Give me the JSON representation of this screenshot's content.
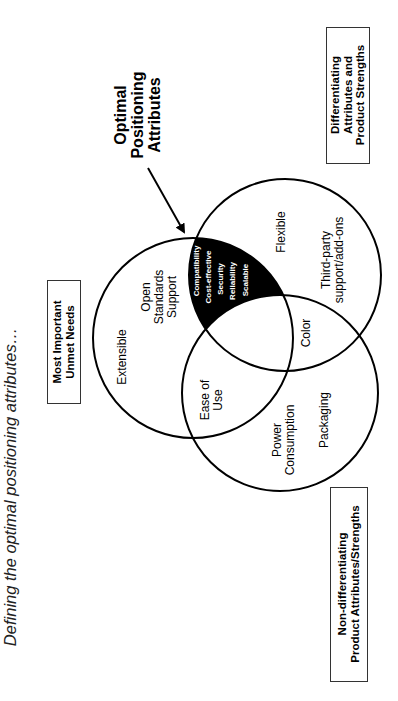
{
  "title": "Defining the optimal positioning attributes…",
  "callout": {
    "line1": "Optimal",
    "line2": "Positioning",
    "line3": "Attributes"
  },
  "boxes": {
    "unmet_needs": {
      "line1": "Most Important",
      "line2": "Unmet Needs"
    },
    "differentiating": {
      "line1": "Differentiating",
      "line2": "Attributes and",
      "line3": "Product Strengths"
    },
    "non_differentiating": {
      "line1": "Non-differentiating",
      "line2": "Product Attributes/Strengths"
    }
  },
  "regions": {
    "unmet_only": {
      "extensible": "Extensible",
      "open_standards": {
        "line1": "Open",
        "line2": "Standards",
        "line3": "Support"
      }
    },
    "unmet_and_non_diff": {
      "line1": "Ease of",
      "line2": "Use"
    },
    "optimal_intersection": [
      "Compatibility",
      "Cost-effective",
      "Security",
      "Reliability",
      "Scalable"
    ],
    "differentiating_only": {
      "flexible": "Flexible",
      "third_party": {
        "line1": "Third-party",
        "line2": "support/add-ons"
      }
    },
    "diff_and_non_diff": "Color",
    "non_diff_only": {
      "power": {
        "line1": "Power",
        "line2": "Consumption"
      },
      "packaging": "Packaging"
    }
  },
  "colors": {
    "line": "#000000",
    "highlight": "#000000",
    "background": "#ffffff"
  }
}
